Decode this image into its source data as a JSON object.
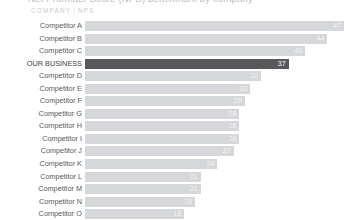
{
  "title": "Net Promoter Score (NPS) benchmark by company",
  "header": {
    "company_label": "COMPANY",
    "separator": "|",
    "nps_label": "NPS"
  },
  "colors": {
    "bar": "#d5d7da",
    "highlight_bar": "#56585b",
    "label_text": "#58595b",
    "value_text": "#f3f4f5",
    "header_text": "#c9ccd0",
    "background": "#ffffff"
  },
  "chart_data": {
    "type": "bar",
    "orientation": "horizontal",
    "title": "Net Promoter Score (NPS) benchmark by company",
    "xlabel": "NPS",
    "ylabel": "COMPANY",
    "grid": false,
    "legend": false,
    "xlim": [
      0,
      47
    ],
    "value_labels": true,
    "highlight_category": "OUR BUSINESS",
    "categories": [
      "Competitor A",
      "Competitor B",
      "Competitor C",
      "OUR BUSINESS",
      "Competitor D",
      "Competitor E",
      "Competitor F",
      "Competitor G",
      "Competitor H",
      "Competitor I",
      "Competitor J",
      "Competitor K",
      "Competitor L",
      "Competitor M",
      "Competitor N",
      "Competitor O"
    ],
    "values": [
      47,
      44,
      40,
      37,
      32,
      30,
      29,
      28,
      28,
      28,
      27,
      24,
      21,
      21,
      20,
      18
    ]
  },
  "rows": [
    {
      "label": "Competitor A",
      "value": "47",
      "pct": 100.0,
      "highlight": false
    },
    {
      "label": "Competitor B",
      "value": "44",
      "pct": 93.6,
      "highlight": false
    },
    {
      "label": "Competitor C",
      "value": "40",
      "pct": 85.1,
      "highlight": false
    },
    {
      "label": "OUR BUSINESS",
      "value": "37",
      "pct": 78.7,
      "highlight": true
    },
    {
      "label": "Competitor D",
      "value": "32",
      "pct": 68.1,
      "highlight": false
    },
    {
      "label": "Competitor E",
      "value": "30",
      "pct": 63.8,
      "highlight": false
    },
    {
      "label": "Competitor F",
      "value": "29",
      "pct": 61.7,
      "highlight": false
    },
    {
      "label": "Competitor G",
      "value": "28",
      "pct": 59.6,
      "highlight": false
    },
    {
      "label": "Competitor H",
      "value": "28",
      "pct": 59.6,
      "highlight": false
    },
    {
      "label": "Competitor I",
      "value": "28",
      "pct": 59.6,
      "highlight": false
    },
    {
      "label": "Competitor J",
      "value": "27",
      "pct": 57.4,
      "highlight": false
    },
    {
      "label": "Competitor K",
      "value": "24",
      "pct": 51.1,
      "highlight": false
    },
    {
      "label": "Competitor L",
      "value": "21",
      "pct": 44.7,
      "highlight": false
    },
    {
      "label": "Competitor M",
      "value": "21",
      "pct": 44.7,
      "highlight": false
    },
    {
      "label": "Competitor N",
      "value": "20",
      "pct": 42.6,
      "highlight": false
    },
    {
      "label": "Competitor O",
      "value": "18",
      "pct": 38.3,
      "highlight": false
    }
  ]
}
